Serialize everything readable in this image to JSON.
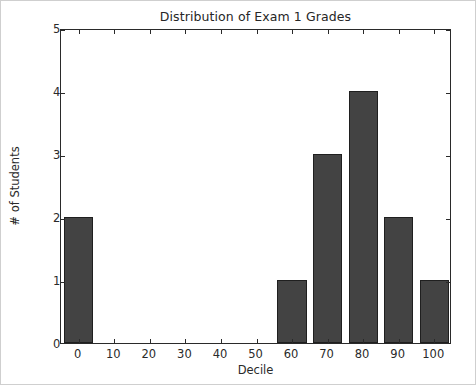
{
  "chart_data": {
    "type": "bar",
    "title": "Distribution of Exam 1 Grades",
    "xlabel": "Decile",
    "ylabel": "# of Students",
    "categories": [
      "0",
      "10",
      "20",
      "30",
      "40",
      "50",
      "60",
      "70",
      "80",
      "90",
      "100"
    ],
    "values": [
      2,
      0,
      0,
      0,
      0,
      0,
      1,
      3,
      4,
      2,
      1
    ],
    "xlim": [
      -5,
      105
    ],
    "ylim": [
      0,
      5
    ],
    "xticks": [
      "0",
      "10",
      "20",
      "30",
      "40",
      "50",
      "60",
      "70",
      "80",
      "90",
      "100"
    ],
    "yticks": [
      "0",
      "1",
      "2",
      "3",
      "4",
      "5"
    ],
    "grid": false,
    "legend": null,
    "bar_color": "#434343",
    "bar_edge_color": "#1f1f1f",
    "axes_color": "#2a2a2a",
    "background_color": "#ffffff"
  }
}
